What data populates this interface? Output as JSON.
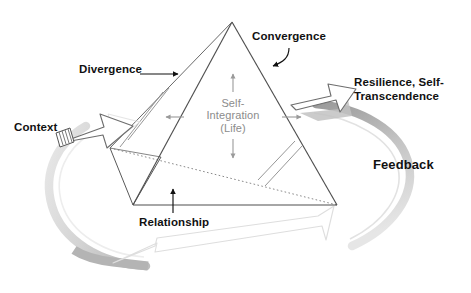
{
  "diagram": {
    "type": "conceptual-diagram",
    "background_color": "#ffffff",
    "center": {
      "line1": "Self-",
      "line2": "Integration",
      "line3": "(Life)",
      "color": "#8c8c8c"
    },
    "labels": {
      "convergence": "Convergence",
      "divergence": "Divergence",
      "resilience_line1": "Resilience, Self-",
      "resilience_line2": "Transcendence",
      "context": "Context",
      "feedback": "Feedback",
      "relationship": "Relationship"
    },
    "colors": {
      "ink": "#111111",
      "pyramid_edge": "#555555",
      "hidden_edge": "#777777",
      "center_text": "#8c8c8c",
      "loop_band_dark": "#a8a8a8",
      "loop_band_light": "#d8d8d8",
      "arrow_outline": "#777777",
      "arrow_outline_faint": "#d0d0d0",
      "arrow_fill": "#ffffff",
      "shadow": "#bdbdbd"
    },
    "shapes": {
      "pyramid_apex": "232,22",
      "pyramid_base_left": "133,205",
      "pyramid_base_right": "337,205",
      "pyramid_back_left_vertex": "110,148",
      "hidden_back_edge": "dotted"
    }
  }
}
